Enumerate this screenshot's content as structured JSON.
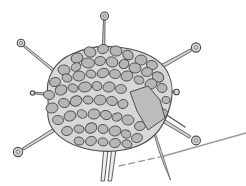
{
  "figure": {
    "background": "#ffffff",
    "canvas": {
      "width": 246,
      "height": 186
    },
    "colors": {
      "body_fill": "#d8d8d8",
      "body_stroke": "#4a4a4a",
      "capsomere_fill": "#b6b6b6",
      "capsomere_stroke": "#4d4d4d",
      "facet_fill": "#bcbcbc",
      "facet_stroke": "#4d4d4d",
      "fiber_fill": "#d2d2d2",
      "fiber_stroke": "#565656",
      "knob_fill": "#d8d8d8",
      "knob_stroke": "#4a4a4a",
      "knob_inner_stroke": "#7a7a7a",
      "leg_fill": "#ececec",
      "leg_stroke": "#5e5e5e",
      "blade_fill": "#cfcfcf",
      "blade_stroke": "#6a6a6a",
      "surface_line": "#9a9a9a"
    },
    "body_path": "M48,95 C45,78 55,61 72,54 C85,48 100,45 115,47 C135,48 155,55 165,68 C172,78 174,92 170,106 C166,122 158,136 142,144 C128,151 108,153 92,150 C76,147 60,140 52,128 C45,118 49,106 48,95 Z",
    "capsomeres": [
      [
        90,
        52,
        6,
        5,
        20
      ],
      [
        103,
        49,
        5.5,
        4.5,
        -15
      ],
      [
        116,
        51,
        6,
        5,
        10
      ],
      [
        128,
        55,
        5.5,
        4.5,
        30
      ],
      [
        77,
        58,
        6,
        5,
        -20
      ],
      [
        141,
        60,
        6,
        5,
        0
      ],
      [
        152,
        65,
        5.5,
        4.5,
        15
      ],
      [
        64,
        70,
        6,
        5,
        10
      ],
      [
        76,
        67,
        5,
        4,
        -25
      ],
      [
        88,
        63,
        6.5,
        5,
        5
      ],
      [
        100,
        61,
        5.5,
        4.5,
        -10
      ],
      [
        112,
        62,
        6,
        5,
        20
      ],
      [
        124,
        64,
        5,
        4.5,
        -30
      ],
      [
        135,
        68,
        6,
        5,
        12
      ],
      [
        147,
        72,
        5.5,
        4.5,
        -8
      ],
      [
        158,
        77,
        6,
        5,
        25
      ],
      [
        55,
        82,
        5.5,
        4.5,
        -15
      ],
      [
        67,
        78,
        5,
        4,
        20
      ],
      [
        79,
        76,
        6,
        5,
        -5
      ],
      [
        91,
        74,
        5,
        4,
        15
      ],
      [
        103,
        73,
        6,
        4.5,
        -20
      ],
      [
        115,
        74,
        5.5,
        4.5,
        8
      ],
      [
        127,
        76,
        6,
        5,
        -12
      ],
      [
        139,
        80,
        5,
        4,
        22
      ],
      [
        151,
        84,
        6,
        5,
        -18
      ],
      [
        162,
        88,
        5,
        4.5,
        10
      ],
      [
        49,
        95,
        5.5,
        4.5,
        12
      ],
      [
        61,
        90,
        6,
        5,
        -22
      ],
      [
        73,
        88,
        5,
        4,
        18
      ],
      [
        85,
        87,
        6.5,
        5,
        -8
      ],
      [
        97,
        86,
        5,
        4.5,
        25
      ],
      [
        109,
        87,
        6,
        5,
        -15
      ],
      [
        121,
        89,
        5.5,
        4.5,
        5
      ],
      [
        166,
        100,
        4,
        3.5,
        10
      ],
      [
        52,
        108,
        6,
        5,
        -10
      ],
      [
        64,
        103,
        5.5,
        4.5,
        15
      ],
      [
        76,
        101,
        6,
        5,
        -25
      ],
      [
        88,
        100,
        5,
        4,
        10
      ],
      [
        100,
        100,
        6,
        5,
        -5
      ],
      [
        112,
        101,
        5.5,
        4.5,
        20
      ],
      [
        123,
        104,
        5,
        4.5,
        -15
      ],
      [
        163,
        113,
        4.5,
        4,
        -10
      ],
      [
        58,
        120,
        5.5,
        4.5,
        8
      ],
      [
        70,
        116,
        6,
        5,
        -18
      ],
      [
        82,
        114,
        5,
        4,
        25
      ],
      [
        94,
        114,
        6,
        5,
        -10
      ],
      [
        106,
        115,
        5.5,
        4.5,
        15
      ],
      [
        117,
        117,
        5,
        4,
        -22
      ],
      [
        128,
        120,
        6,
        5,
        5
      ],
      [
        140,
        126,
        5.5,
        4.5,
        -12
      ],
      [
        67,
        131,
        5.5,
        4.5,
        -15
      ],
      [
        79,
        129,
        5,
        4,
        10
      ],
      [
        91,
        128,
        6,
        5,
        -25
      ],
      [
        103,
        129,
        5,
        4.5,
        18
      ],
      [
        115,
        131,
        6,
        5,
        -8
      ],
      [
        126,
        134,
        5,
        4,
        22
      ],
      [
        137,
        138,
        5.5,
        4.5,
        -15
      ],
      [
        79,
        141,
        5,
        4,
        12
      ],
      [
        91,
        141,
        5.5,
        4.5,
        -20
      ],
      [
        103,
        142,
        5,
        4,
        8
      ],
      [
        115,
        143,
        5.5,
        4.5,
        -12
      ],
      [
        127,
        144,
        5,
        4,
        20
      ]
    ],
    "facet_points": "130,92 148,86 160,100 165,118 148,130 137,111",
    "fibers": [
      {
        "name": "top",
        "shaft": [
          [
            103.5,
            48
          ],
          [
            104.3,
            20
          ]
        ],
        "width": 2.4,
        "knob": {
          "x": 104.5,
          "y": 16,
          "r": 4.0
        }
      },
      {
        "name": "upper-left",
        "shaft": [
          [
            58,
            74
          ],
          [
            24,
            46
          ]
        ],
        "width": 2.6,
        "knob": {
          "x": 21,
          "y": 43,
          "r": 3.8
        }
      },
      {
        "name": "upper-right",
        "shaft": [
          [
            157,
            69
          ],
          [
            191,
            50
          ]
        ],
        "width": 3.6,
        "knob": {
          "x": 196,
          "y": 47.5,
          "r": 4.6
        }
      },
      {
        "name": "left-stub",
        "shaft": [
          [
            44,
            94
          ],
          [
            35,
            93
          ]
        ],
        "width": 2.2,
        "knob": {
          "x": 32.5,
          "y": 93,
          "r": 2.2
        }
      },
      {
        "name": "right-stub",
        "shaft": [
          [
            167,
            91
          ],
          [
            174,
            92
          ]
        ],
        "width": 2.2,
        "knob": {
          "x": 176.5,
          "y": 92,
          "r": 2.8
        }
      },
      {
        "name": "lower-left",
        "shaft": [
          [
            54,
            130
          ],
          [
            23,
            149
          ]
        ],
        "width": 3.4,
        "knob": {
          "x": 18,
          "y": 152,
          "r": 4.6
        }
      },
      {
        "name": "lower-right",
        "shaft": [
          [
            149,
            112
          ],
          [
            190,
            137
          ]
        ],
        "width": 3.8,
        "knob": {
          "x": 196,
          "y": 140.5,
          "r": 4.4
        }
      }
    ],
    "extra_fiber": {
      "x1": 153,
      "y1": 106,
      "x2": 185,
      "y2": 127,
      "width": 1.4
    },
    "legs": [
      {
        "points": "104,146 108.5,146 104.5,181 101,181"
      },
      {
        "points": "112,146 116.5,146 111.5,181 108,181"
      }
    ],
    "blade_path": "M151.5,122 Q162,152 170.5,180 Q156,148 151.5,122 Z",
    "surface_line": {
      "dashed": {
        "x1": 119,
        "y1": 166,
        "x2": 164,
        "y2": 156
      },
      "solid": {
        "x1": 164,
        "y1": 156,
        "x2": 246,
        "y2": 133
      }
    }
  }
}
